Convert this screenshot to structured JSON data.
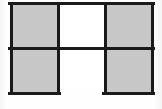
{
  "figure": {
    "type": "geometric-square-grid",
    "canvas": {
      "width": 162,
      "height": 109
    },
    "background_color": "#fdfdfd",
    "stroke_color": "#1a1a1a",
    "stroke_width": 3,
    "fill_color": "#c9c9c9",
    "fill_texture": "fine-gray-halftone",
    "grid": {
      "columns": 3,
      "rows": 2,
      "cell_width": 47,
      "cell_height": 45,
      "origin_x": 11,
      "origin_y": 3
    },
    "cells": [
      {
        "name": "top-left-square",
        "row": 0,
        "column": 0,
        "x": 11,
        "y": 3,
        "width": 47,
        "height": 45,
        "filled": true,
        "fill": "#c9c9c9",
        "edges": {
          "top": true,
          "right": true,
          "bottom": true,
          "left": true
        }
      },
      {
        "name": "top-center-square",
        "row": 0,
        "column": 1,
        "x": 58,
        "y": 3,
        "width": 47,
        "height": 45,
        "filled": false,
        "fill": "#ffffff",
        "edges": {
          "top": true,
          "right": true,
          "bottom": true,
          "left": true
        }
      },
      {
        "name": "top-right-square",
        "row": 0,
        "column": 2,
        "x": 105,
        "y": 3,
        "width": 47,
        "height": 45,
        "filled": true,
        "fill": "#c9c9c9",
        "edges": {
          "top": true,
          "right": true,
          "bottom": true,
          "left": true
        }
      },
      {
        "name": "bottom-left-square",
        "row": 1,
        "column": 0,
        "x": 11,
        "y": 48,
        "width": 47,
        "height": 45,
        "filled": true,
        "fill": "#c9c9c9",
        "edges": {
          "top": true,
          "right": true,
          "bottom": true,
          "left": true
        }
      },
      {
        "name": "bottom-center-gap",
        "row": 1,
        "column": 1,
        "x": 58,
        "y": 48,
        "width": 47,
        "height": 45,
        "filled": false,
        "fill": "#ffffff",
        "edges": {
          "top": true,
          "right": true,
          "bottom": false,
          "left": true
        }
      },
      {
        "name": "bottom-right-square",
        "row": 1,
        "column": 2,
        "x": 105,
        "y": 48,
        "width": 47,
        "height": 45,
        "filled": true,
        "fill": "#c9c9c9",
        "edges": {
          "top": true,
          "right": true,
          "bottom": true,
          "left": true
        }
      }
    ],
    "labels": []
  }
}
